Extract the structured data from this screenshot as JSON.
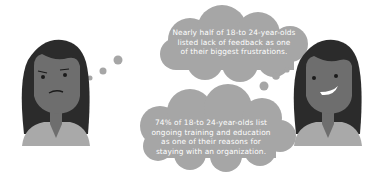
{
  "colors": {
    "background": "#ffffff",
    "bubble": "#a6a6a6",
    "hair": "#2b2b2b",
    "skin": "#6e6e6e",
    "shirt": "#a9a9a9",
    "text": "#ffffff"
  },
  "bubbles": [
    {
      "id": "top",
      "lines": [
        "Nearly half of 18-to 24-year-olds",
        "listed lack of feedback as one",
        "of their biggest frustrations."
      ]
    },
    {
      "id": "bottom",
      "lines": [
        "74% of 18-to 24-year-olds list",
        "ongoing training and education",
        "as one of their reasons for",
        "staying with an organization."
      ]
    }
  ],
  "characters": [
    {
      "position": "left",
      "expression": "frustrated"
    },
    {
      "position": "right",
      "expression": "smiling"
    }
  ]
}
